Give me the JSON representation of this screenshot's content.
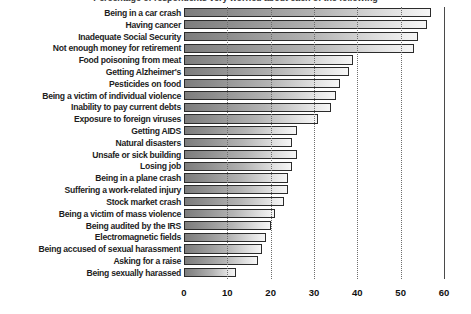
{
  "chart_data": {
    "type": "bar",
    "orientation": "horizontal",
    "title": "Percentage of respondents very worried about each of the following",
    "xlabel": "",
    "ylabel": "",
    "xlim": [
      0,
      60
    ],
    "xticks": [
      0,
      10,
      20,
      30,
      40,
      50,
      60
    ],
    "xticklabels": [
      "0",
      "10",
      "20",
      "30",
      "40",
      "50",
      "60"
    ],
    "grid": "vertical-dotted",
    "legend": "none",
    "categories": [
      "Being in a car crash",
      "Having cancer",
      "Inadequate Social Security",
      "Not enough money for retirement",
      "Food poisoning from meat",
      "Getting Alzheimer's",
      "Pesticides on food",
      "Being a victim of individual violence",
      "Inability to pay current debts",
      "Exposure to foreign viruses",
      "Getting AIDS",
      "Natural disasters",
      "Unsafe or sick building",
      "Losing job",
      "Being in a plane crash",
      "Suffering a work-related injury",
      "Stock market crash",
      "Being a victim of mass violence",
      "Being audited by the IRS",
      "Electromagnetic fields",
      "Being accused of sexual harassment",
      "Asking for a raise",
      "Being sexually harassed"
    ],
    "values": [
      57,
      56,
      54,
      53,
      39,
      38,
      36,
      35,
      34,
      31,
      26,
      25,
      26,
      25,
      24,
      24,
      23,
      21,
      20,
      19,
      18,
      17,
      12
    ]
  },
  "axis": {
    "tick_0": "0",
    "tick_1": "10",
    "tick_2": "20",
    "tick_3": "30",
    "tick_4": "40",
    "tick_5": "50",
    "tick_6": "60"
  },
  "colors": {
    "bar_gradient_start": "#7d7d7d",
    "bar_gradient_end": "#f6f6f6",
    "bar_border": "#2b2b2b",
    "gridline": "#6e6e6e",
    "axis_line": "#4a4a4a",
    "label_text": "#1d1d1d",
    "background": "#ffffff"
  }
}
